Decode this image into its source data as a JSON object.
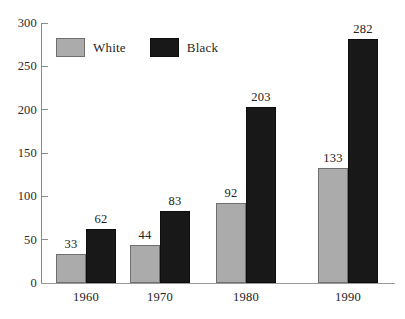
{
  "chart_data": {
    "type": "bar",
    "title": "",
    "subtitle": "",
    "xlabel": "",
    "ylabel": "",
    "categories": [
      "1960",
      "1970",
      "1980",
      "1990"
    ],
    "series": [
      {
        "name": "White",
        "color": "#ababab",
        "values": [
          33,
          44,
          92,
          133
        ]
      },
      {
        "name": "Black",
        "color": "#181818",
        "values": [
          62,
          83,
          203,
          282
        ]
      }
    ],
    "value_labels": {
      "White": [
        "33",
        "44",
        "92",
        "133"
      ],
      "Black": [
        "62",
        "83",
        "203",
        "282"
      ]
    },
    "ylim": [
      0,
      300
    ],
    "yticks": [
      0,
      50,
      100,
      150,
      200,
      250,
      300
    ],
    "ytick_labels": [
      "0",
      "50",
      "100",
      "150",
      "200",
      "250",
      "300"
    ],
    "xtick_labels": [
      "1960",
      "1970",
      "1980",
      "1990"
    ],
    "grid": false,
    "legend": {
      "position": "top-left",
      "entries": [
        {
          "label": "White",
          "swatch": "gray-swatch"
        },
        {
          "label": "Black",
          "swatch": "black-swatch"
        }
      ]
    },
    "axis_color": "#8a8a8a",
    "background": "#ffffff"
  }
}
